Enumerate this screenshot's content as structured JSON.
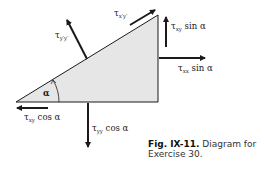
{
  "figure": {
    "caption_label": "Fig. IX-11.",
    "caption_text": "Diagram for Exercise 30.",
    "colors": {
      "fill": "#e6e6e6",
      "stroke": "#1a1a1a",
      "text": "#1a1a1a"
    }
  },
  "labels": {
    "angle": "α",
    "tau_yprime": {
      "sym": "τ",
      "sub": "y′y′",
      "rest": ""
    },
    "tau_xprime": {
      "sym": "τ",
      "sub": "x′y′",
      "rest": ""
    },
    "tau_xy_sin": {
      "sym": "τ",
      "sub": "xy",
      "rest": " sin α"
    },
    "tau_xx_sin": {
      "sym": "τ",
      "sub": "xx",
      "rest": " sin α"
    },
    "tau_xy_cos": {
      "sym": "τ",
      "sub": "xy",
      "rest": " cos α"
    },
    "tau_yy_cos": {
      "sym": "τ",
      "sub": "yy",
      "rest": " cos α"
    }
  }
}
